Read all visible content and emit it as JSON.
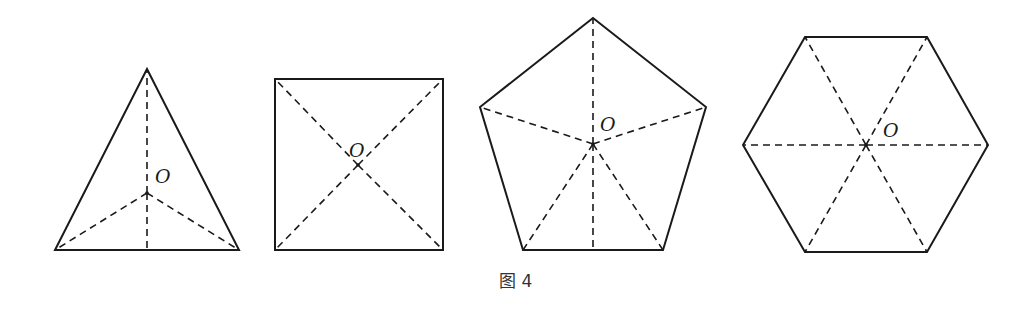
{
  "figure": {
    "caption": "图 4",
    "center_label": "O",
    "colors": {
      "stroke": "#1a1a1a",
      "background": "#ffffff",
      "caption": "#333333"
    },
    "shapes": [
      {
        "name": "equilateral-triangle",
        "sides": 3,
        "vertices": [
          [
            147,
            69
          ],
          [
            239,
            250
          ],
          [
            55,
            250
          ]
        ],
        "center": [
          147,
          193
        ],
        "label": "O",
        "label_pos": [
          155,
          183
        ],
        "extra_dashed": [
          [
            [
              147,
              193
            ],
            [
              147,
              250
            ]
          ]
        ]
      },
      {
        "name": "square",
        "sides": 4,
        "vertices": [
          [
            275,
            79
          ],
          [
            443,
            79
          ],
          [
            443,
            250
          ],
          [
            275,
            250
          ]
        ],
        "center": [
          358,
          165
        ],
        "label": "O",
        "label_pos": [
          349,
          157
        ],
        "extra_dashed": []
      },
      {
        "name": "regular-pentagon",
        "sides": 5,
        "vertices": [
          [
            593,
            18
          ],
          [
            706,
            107
          ],
          [
            663,
            250
          ],
          [
            523,
            250
          ],
          [
            480,
            107
          ]
        ],
        "center": [
          593,
          144
        ],
        "label": "O",
        "label_pos": [
          600,
          131
        ],
        "extra_dashed": [
          [
            [
              593,
              144
            ],
            [
              593,
              250
            ]
          ]
        ]
      },
      {
        "name": "regular-hexagon",
        "sides": 6,
        "vertices": [
          [
            805,
            37
          ],
          [
            927,
            37
          ],
          [
            988,
            145
          ],
          [
            927,
            252
          ],
          [
            805,
            252
          ],
          [
            743,
            145
          ]
        ],
        "center": [
          866,
          145
        ],
        "label": "O",
        "label_pos": [
          883,
          137
        ],
        "extra_dashed": []
      }
    ]
  }
}
